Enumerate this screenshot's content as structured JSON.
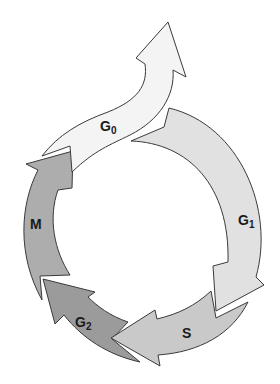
{
  "diagram": {
    "type": "cell-cycle",
    "phases": [
      {
        "id": "g0",
        "label": "G",
        "subscript": "0",
        "fill": "#f4f4f4"
      },
      {
        "id": "g1",
        "label": "G",
        "subscript": "1",
        "fill": "#e1e1e1"
      },
      {
        "id": "s",
        "label": "S",
        "subscript": "",
        "fill": "#c9c9c9"
      },
      {
        "id": "g2",
        "label": "G",
        "subscript": "2",
        "fill": "#9b9b9b"
      },
      {
        "id": "m",
        "label": "M",
        "subscript": "",
        "fill": "#adadad"
      }
    ],
    "stroke": "#3a3a3a"
  },
  "caption": {
    "text": ""
  }
}
